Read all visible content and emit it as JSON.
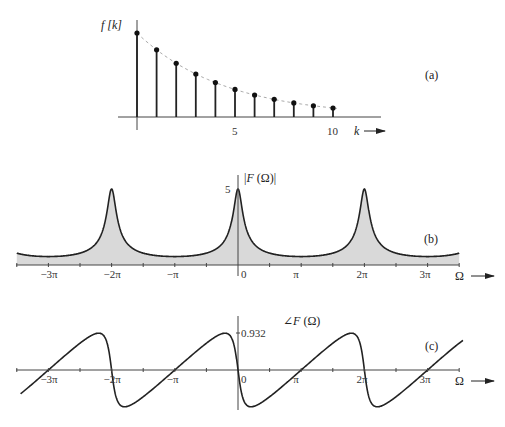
{
  "figure": {
    "panels": [
      "(a)",
      "(b)",
      "(c)"
    ]
  },
  "chart_data": [
    {
      "type": "stem",
      "panel_label": "(a)",
      "ylabel": "f [k]",
      "xlabel": "k",
      "x_ticks": [
        "5",
        "10"
      ],
      "x": [
        0,
        1,
        2,
        3,
        4,
        5,
        6,
        7,
        8,
        9,
        10
      ],
      "values": [
        1.0,
        0.8,
        0.64,
        0.512,
        0.41,
        0.328,
        0.262,
        0.21,
        0.168,
        0.134,
        0.107
      ],
      "envelope": "dashed",
      "grid": false
    },
    {
      "type": "area",
      "panel_label": "(b)",
      "ylabel": "|F (Ω)|",
      "xlabel": "Ω",
      "y_tick": "5",
      "x_ticks": [
        "−3π",
        "−2π",
        "−π",
        "0",
        "π",
        "2π",
        "3π"
      ],
      "xlim_pi": [
        -3.5,
        3.5
      ],
      "peak": 5,
      "minimum": 0.556,
      "a": 0.8,
      "peaks_at_pi": [
        -2,
        0,
        2
      ],
      "grid": false
    },
    {
      "type": "line",
      "panel_label": "(c)",
      "ylabel": "∠F (Ω)",
      "xlabel": "Ω",
      "y_tick": "0.932",
      "x_ticks": [
        "−3π",
        "−2π",
        "−π",
        "0",
        "π",
        "2π",
        "3π"
      ],
      "xlim_pi": [
        -3.5,
        3.5
      ],
      "max": 0.932,
      "min": -0.932,
      "a": 0.8,
      "grid": false
    }
  ]
}
